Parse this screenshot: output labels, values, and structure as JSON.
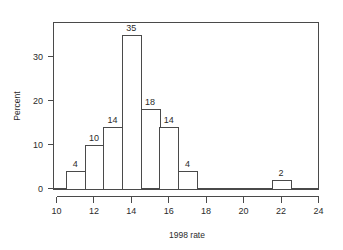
{
  "chart_data": {
    "type": "bar",
    "title": "",
    "subtitle": "",
    "xlabel": "1998 rate",
    "ylabel": "Percent",
    "grid": false,
    "legend": "none",
    "xlim": [
      10,
      24
    ],
    "ylim": [
      0,
      36
    ],
    "xticks": [
      "10",
      "12",
      "14",
      "16",
      "18",
      "20",
      "22",
      "24"
    ],
    "xtick_values": [
      10,
      12,
      14,
      16,
      18,
      20,
      22,
      24
    ],
    "yticks": [
      "0",
      "10",
      "20",
      "30"
    ],
    "ytick_values": [
      0,
      10,
      20,
      30
    ],
    "bin_width": 1,
    "categories": [
      "10.5-11.5",
      "11.5-12.5",
      "12.5-13.5",
      "13.5-14.5",
      "14.5-15.5",
      "15.5-16.5",
      "16.5-17.5",
      "21.5-22.5"
    ],
    "bin_starts": [
      10.5,
      11.5,
      12.5,
      13.5,
      14.5,
      15.5,
      16.5,
      21.5
    ],
    "bin_ends": [
      11.5,
      12.5,
      13.5,
      14.5,
      15.5,
      16.5,
      17.5,
      22.5
    ],
    "bin_centers": [
      11,
      12,
      13,
      14,
      15,
      16,
      17,
      22
    ],
    "values": [
      4,
      10,
      14,
      35,
      18,
      14,
      4,
      2
    ],
    "data_labels": [
      "4",
      "10",
      "14",
      "35",
      "18",
      "14",
      "4",
      "2"
    ],
    "colors": {
      "bar_fill": "#ffffff",
      "bar_stroke": "#4a4a4a",
      "axis": "#4a4a4a",
      "text": "#2b2b2b",
      "background": "#ffffff"
    }
  }
}
